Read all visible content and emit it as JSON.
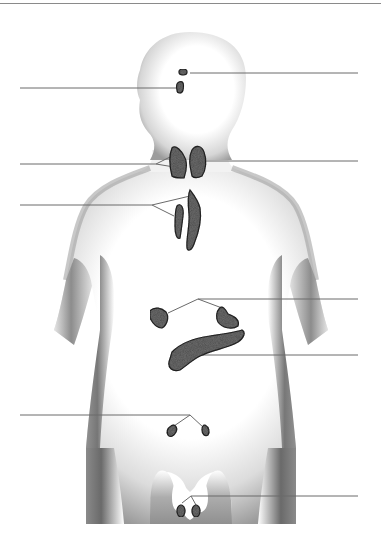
{
  "diagram": {
    "title": "",
    "colors": {
      "background": "#ffffff",
      "body_shade": "#7a7a7a",
      "gland_fill": "#6e6e6e",
      "gland_outline": "#2a2a2a",
      "leader_line": "#6a6a6a"
    },
    "glands": [
      {
        "id": "pineal",
        "name": "pineal gland",
        "side": "right",
        "label": ""
      },
      {
        "id": "pituitary",
        "name": "pituitary gland",
        "side": "left",
        "label": ""
      },
      {
        "id": "parathyroid",
        "name": "parathyroid glands",
        "side": "left",
        "label": ""
      },
      {
        "id": "thyroid",
        "name": "thyroid gland",
        "side": "right",
        "label": ""
      },
      {
        "id": "thymus",
        "name": "thymus",
        "side": "left",
        "label": ""
      },
      {
        "id": "adrenal",
        "name": "adrenal glands",
        "side": "right",
        "label": ""
      },
      {
        "id": "pancreas",
        "name": "pancreas",
        "side": "right",
        "label": ""
      },
      {
        "id": "ovaries",
        "name": "ovaries",
        "side": "left",
        "label": ""
      },
      {
        "id": "testes",
        "name": "testes",
        "side": "right",
        "label": ""
      }
    ],
    "label_blanks_count": 9
  }
}
